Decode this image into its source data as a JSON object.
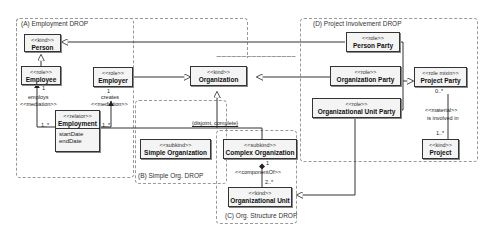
{
  "regions": {
    "a": {
      "label": "(A) Employment DROP"
    },
    "b": {
      "label": "(B) Simple Org. DROP"
    },
    "c": {
      "label": "(C) Org. Structure DROP"
    },
    "d": {
      "label": "(D) Project Involvement DROP"
    }
  },
  "classes": {
    "person": {
      "stereotype": "<<kind>>",
      "name": "Person"
    },
    "employee": {
      "stereotype": "<<role>>",
      "name": "Employee"
    },
    "employer": {
      "stereotype": "<<role>>",
      "name": "Employer"
    },
    "employment": {
      "stereotype": "<<relator>>",
      "name": "Employment",
      "attributes": [
        "startDate",
        "endDate"
      ]
    },
    "organization": {
      "stereotype": "<<kind>>",
      "name": "Organization"
    },
    "simple_org": {
      "stereotype": "<<subkind>>",
      "name": "Simple Organization"
    },
    "complex_org": {
      "stereotype": "<<subkind>>",
      "name": "Complex Organization"
    },
    "org_unit": {
      "stereotype": "<<kind>>",
      "name": "Organizational Unit"
    },
    "person_party": {
      "stereotype": "<<role>>",
      "name": "Person Party"
    },
    "org_party": {
      "stereotype": "<<role>>",
      "name": "Organization Party"
    },
    "org_unit_party": {
      "stereotype": "<<role>>",
      "name": "Organizational Unit Party"
    },
    "project_party": {
      "stereotype": "<<role mixin>>",
      "name": "Project Party"
    },
    "project": {
      "stereotype": "<<kind>>",
      "name": "Project"
    }
  },
  "labels": {
    "employs": "employs",
    "employs_med": "<<mediation>>",
    "employs_mult_top": "1",
    "employs_mult_bottom": "1..*",
    "creates": "creates",
    "creates_med": "<<mediation>>",
    "creates_mult_top": "1",
    "creates_mult_bottom": "1..*",
    "genset": "{disjoint, complete}",
    "component_of": "<<componentOf>>",
    "comp_mult_top": "1",
    "comp_mult_bottom": "2..*",
    "material": "<<material>>",
    "involved": "is involved in",
    "mat_mult_top": "0..*",
    "mat_mult_bottom": "1..*"
  }
}
